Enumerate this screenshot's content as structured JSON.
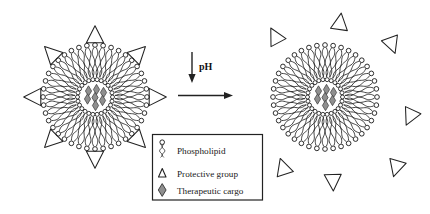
{
  "figure": {
    "type": "scientific-schematic",
    "background_color": "#ffffff",
    "stroke_color": "#222222",
    "cargo_fill": "#8f8f8f"
  },
  "reaction": {
    "condition_label": "pH",
    "down_arrow": "decrease",
    "direction": "left-to-right"
  },
  "states": [
    {
      "id": "intact-micelle",
      "position": "left",
      "center_x": 95,
      "center_y": 97,
      "lipid_count": 40,
      "cargo_count": 7,
      "protective_group_count": 8,
      "protective_groups_attached": true
    },
    {
      "id": "deshielded-micelle",
      "position": "right",
      "center_x": 325,
      "center_y": 97,
      "lipid_count": 40,
      "cargo_count": 7,
      "protective_group_count": 7,
      "protective_groups_attached": false
    }
  ],
  "scattered_groups": [
    {
      "x": 340,
      "y": 22,
      "rot": 8
    },
    {
      "x": 275,
      "y": 36,
      "rot": -28
    },
    {
      "x": 392,
      "y": 45,
      "rot": 160
    },
    {
      "x": 410,
      "y": 117,
      "rot": 205
    },
    {
      "x": 283,
      "y": 167,
      "rot": -18
    },
    {
      "x": 333,
      "y": 182,
      "rot": 178
    },
    {
      "x": 396,
      "y": 168,
      "rot": 196
    }
  ],
  "legend": {
    "border_color": "#222222",
    "items": [
      {
        "icon": "phospholipid-icon",
        "label": "Phospholipid"
      },
      {
        "icon": "triangle-icon",
        "label": "Protective group"
      },
      {
        "icon": "diamond-icon",
        "label": "Therapeutic cargo"
      }
    ]
  }
}
